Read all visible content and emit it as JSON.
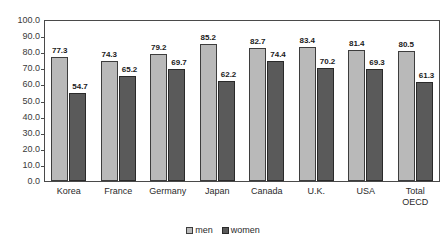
{
  "chart_data": {
    "type": "bar",
    "title": "",
    "subtitle": "",
    "xlabel": "",
    "ylabel": "",
    "categories": [
      "Korea",
      "France",
      "Germany",
      "Japan",
      "Canada",
      "U.K.",
      "USA",
      "Total\nOECD"
    ],
    "series": [
      {
        "name": "men",
        "color": "#b9b9b9",
        "values": [
          77.3,
          74.3,
          79.2,
          85.2,
          82.7,
          83.4,
          81.4,
          80.5
        ],
        "labels": [
          "77.3",
          "74.3",
          "79.2",
          "85.2",
          "82.7",
          "83.4",
          "81.4",
          "80.5"
        ]
      },
      {
        "name": "women",
        "color": "#5a5a5a",
        "values": [
          54.7,
          65.2,
          69.7,
          62.2,
          74.4,
          70.2,
          69.3,
          61.3
        ],
        "labels": [
          "54.7",
          "65.2",
          "69.7",
          "62.2",
          "74.4",
          "70.2",
          "69.3",
          "61.3"
        ]
      }
    ],
    "ylim": [
      0.0,
      100.0
    ],
    "ytick_step": 10.0,
    "ytick_labels": [
      "100.0",
      "90.0",
      "80.0",
      "70.0",
      "60.0",
      "50.0",
      "40.0",
      "30.0",
      "20.0",
      "10.0",
      "0.0"
    ],
    "ytick_values": [
      100.0,
      90.0,
      80.0,
      70.0,
      60.0,
      50.0,
      40.0,
      30.0,
      20.0,
      10.0,
      0.0
    ],
    "grid": false,
    "legend_position": "bottom-center",
    "legend_entries": [
      "men",
      "women"
    ]
  }
}
